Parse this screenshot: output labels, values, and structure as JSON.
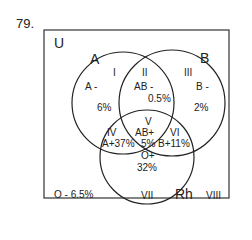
{
  "question_number": "79.",
  "universe_label": "U",
  "sets": {
    "A": "A",
    "B": "B",
    "Rh": "Rh"
  },
  "regions": [
    {
      "id": "I",
      "numeral": "I",
      "type": "A -",
      "percent": "6%"
    },
    {
      "id": "II",
      "numeral": "II",
      "type": "AB -",
      "percent": "0.5%"
    },
    {
      "id": "III",
      "numeral": "III",
      "type": "B -",
      "percent": "2%"
    },
    {
      "id": "IV",
      "numeral": "IV",
      "type_percent": "A+37%"
    },
    {
      "id": "V",
      "numeral": "V",
      "type": "AB+",
      "percent": "5%"
    },
    {
      "id": "VI",
      "numeral": "VI",
      "type_percent": "B+11%"
    },
    {
      "id": "VII",
      "numeral": "VII",
      "type": "O+",
      "percent": "32%"
    },
    {
      "id": "VIII",
      "numeral": "VIII",
      "type_percent": "O -  6.5%"
    }
  ],
  "colors": {
    "line": "#222222",
    "background": "#ffffff"
  }
}
